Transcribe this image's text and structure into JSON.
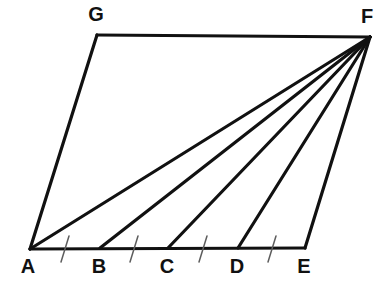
{
  "figure": {
    "background_color": "#ffffff",
    "stroke_color": "#111111",
    "tick_color": "#5d5d5d",
    "line_width": 3.2,
    "width": 386,
    "height": 286
  },
  "points": {
    "A": {
      "label": "A",
      "x": 30,
      "y": 249,
      "label_x": 28,
      "label_y": 268
    },
    "B": {
      "label": "B",
      "x": 100,
      "y": 248,
      "label_x": 99,
      "label_y": 268
    },
    "C": {
      "label": "C",
      "x": 168,
      "y": 248,
      "label_x": 167,
      "label_y": 268
    },
    "D": {
      "label": "D",
      "x": 238,
      "y": 248,
      "label_x": 237,
      "label_y": 268
    },
    "E": {
      "label": "E",
      "x": 305,
      "y": 248,
      "label_x": 304,
      "label_y": 268
    },
    "F": {
      "label": "F",
      "x": 370,
      "y": 37,
      "label_x": 367,
      "label_y": 18
    },
    "G": {
      "label": "G",
      "x": 97,
      "y": 35,
      "label_x": 96,
      "label_y": 16
    }
  },
  "edges": [
    {
      "name": "edge-A-G",
      "from": "A",
      "to": "G",
      "path": "M 30 249 L 97 35"
    },
    {
      "name": "edge-G-F",
      "from": "G",
      "to": "F",
      "path": "M 97 35 L 370 37"
    },
    {
      "name": "edge-F-E",
      "from": "F",
      "to": "E",
      "path": "M 370 37 L 305 248"
    },
    {
      "name": "edge-A-E-baseline",
      "from": "A",
      "to": "E",
      "path": "M 30 249 L 305 248"
    }
  ],
  "cevians": [
    {
      "name": "cevian-F-A",
      "from": "F",
      "to": "A",
      "path": "M 370 37 L 30 249"
    },
    {
      "name": "cevian-F-B",
      "from": "F",
      "to": "B",
      "path": "M 370 37 L 100 248"
    },
    {
      "name": "cevian-F-C",
      "from": "F",
      "to": "C",
      "path": "M 370 37 L 168 248"
    },
    {
      "name": "cevian-F-D",
      "from": "F",
      "to": "D",
      "path": "M 370 37 L 238 248"
    }
  ],
  "ticks": [
    {
      "name": "tick-AB",
      "between": "A-B",
      "path": "M 61 262 L 69 236"
    },
    {
      "name": "tick-BC",
      "between": "B-C",
      "path": "M 130 262 L 138 236"
    },
    {
      "name": "tick-CD",
      "between": "C-D",
      "path": "M 199 262 L 207 236"
    },
    {
      "name": "tick-DE",
      "between": "D-E",
      "path": "M 268 262 L 276 236"
    }
  ]
}
